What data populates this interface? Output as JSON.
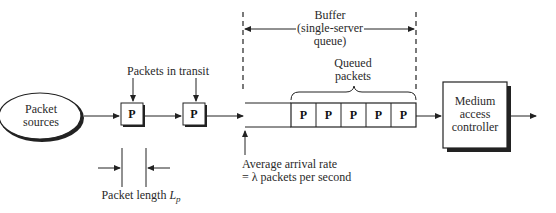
{
  "diagram": {
    "nodes": {
      "source": {
        "line1": "Packet",
        "line2": "sources"
      },
      "mac": {
        "line1": "Medium",
        "line2": "access",
        "line3": "controller"
      }
    },
    "transit_packets": [
      {
        "label": "P"
      },
      {
        "label": "P"
      }
    ],
    "queued_packets": [
      {
        "label": "P"
      },
      {
        "label": "P"
      },
      {
        "label": "P"
      },
      {
        "label": "P"
      },
      {
        "label": "P"
      }
    ],
    "labels": {
      "packets_in_transit": "Packets in transit",
      "buffer_line1": "Buffer",
      "buffer_line2": "(single-server",
      "buffer_line3": "queue)",
      "queued_line1": "Queued",
      "queued_line2": "packets",
      "arrival_line1": "Average arrival rate",
      "arrival_line2": "= λ packets per second",
      "packet_length": "Packet length ",
      "packet_length_symbol": "L",
      "packet_length_sub": "p"
    }
  }
}
